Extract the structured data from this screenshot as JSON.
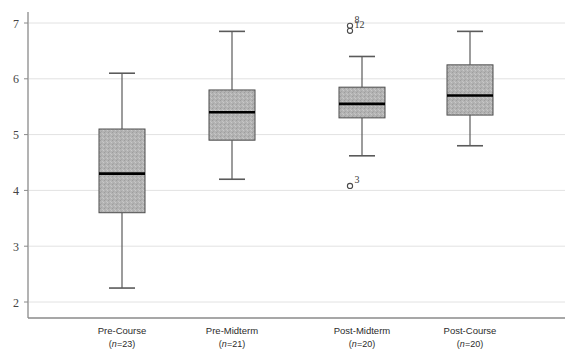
{
  "chart_data": {
    "type": "box",
    "title": "",
    "xlabel": "",
    "ylabel": "",
    "ylim": [
      2,
      7
    ],
    "yticks": [
      2,
      3,
      4,
      5,
      6,
      7
    ],
    "ytick_labels": [
      "2",
      "3",
      "4",
      "5",
      "6",
      "7"
    ],
    "grid": true,
    "grid_axis": "y",
    "legend": "none",
    "categories": [
      "Pre-Course",
      "Pre-Midterm",
      "Post-Midterm",
      "Post-Course"
    ],
    "category_sublabels": [
      "(n=23)",
      "(n=21)",
      "(n=20)",
      "(n=20)"
    ],
    "sample_sizes": [
      23,
      21,
      20,
      20
    ],
    "boxes": [
      {
        "category": "Pre-Course",
        "n": 23,
        "whisker_low": 2.25,
        "q1": 3.6,
        "median": 4.3,
        "q3": 5.1,
        "whisker_high": 6.1,
        "outliers": []
      },
      {
        "category": "Pre-Midterm",
        "n": 21,
        "whisker_low": 4.2,
        "q1": 4.9,
        "median": 5.4,
        "q3": 5.8,
        "whisker_high": 6.85,
        "outliers": []
      },
      {
        "category": "Post-Midterm",
        "n": 20,
        "whisker_low": 4.62,
        "q1": 5.3,
        "median": 5.55,
        "q3": 5.85,
        "whisker_high": 6.4,
        "outliers": [
          {
            "value": 6.95,
            "label": "8"
          },
          {
            "value": 6.86,
            "label": "12"
          },
          {
            "value": 4.08,
            "label": "3"
          }
        ]
      },
      {
        "category": "Post-Course",
        "n": 20,
        "whisker_low": 4.8,
        "q1": 5.35,
        "median": 5.7,
        "q3": 6.25,
        "whisker_high": 6.85,
        "outliers": []
      }
    ],
    "colors": {
      "box_fill": "#b3b3b3",
      "box_edge": "#4d4d4d",
      "median": "#000000",
      "whisker": "#5a5a5a",
      "grid": "#e2e2e2",
      "axis": "#8a8a8a",
      "text": "#2b2b2b"
    }
  }
}
